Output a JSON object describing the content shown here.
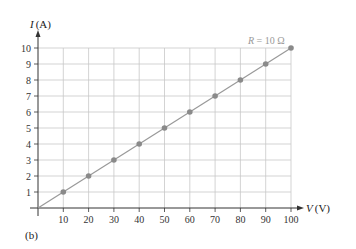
{
  "chart_data": {
    "type": "line",
    "title": "",
    "xlabel": "V (V)",
    "ylabel": "I (A)",
    "x": [
      10,
      20,
      30,
      40,
      50,
      60,
      70,
      80,
      90,
      100
    ],
    "series": [
      {
        "name": "R = 10 Ω",
        "values": [
          1,
          2,
          3,
          4,
          5,
          6,
          7,
          8,
          9,
          10
        ]
      }
    ],
    "xlim": [
      0,
      100
    ],
    "ylim": [
      0,
      10
    ],
    "x_ticks": [
      "10",
      "20",
      "30",
      "40",
      "50",
      "60",
      "70",
      "80",
      "90",
      "100"
    ],
    "y_ticks": [
      "1",
      "2",
      "3",
      "4",
      "5",
      "6",
      "7",
      "8",
      "9",
      "10"
    ],
    "grid": true,
    "annotation": "R = 10 Ω",
    "panel_label": "(b)",
    "colors": {
      "line": "#999999",
      "marker": "#8a8a8a",
      "grid": "#c8c8c8",
      "axis": "#333333"
    }
  },
  "labels": {
    "y_axis_var": "I",
    "y_axis_unit": "(A)",
    "x_axis_var": "V",
    "x_axis_unit": "(V)",
    "annotation_var": "R",
    "annotation_rest": " = 10 Ω",
    "panel": "(b)"
  }
}
